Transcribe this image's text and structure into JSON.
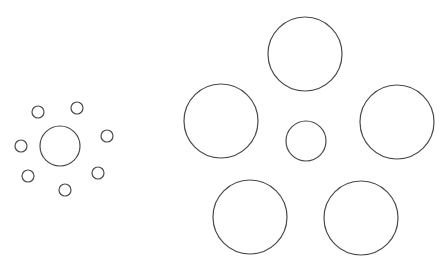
{
  "figure": {
    "name": "Ebbinghaus illusion",
    "width": 447,
    "height": 268,
    "stroke_color": "#4a4a4a",
    "background": "#ffffff"
  },
  "left_cluster": {
    "center": {
      "cx": 60,
      "cy": 146,
      "r": 20
    },
    "surrounding": [
      {
        "cx": 38,
        "cy": 112,
        "r": 6
      },
      {
        "cx": 77,
        "cy": 108,
        "r": 6
      },
      {
        "cx": 107,
        "cy": 136,
        "r": 6
      },
      {
        "cx": 21,
        "cy": 146,
        "r": 6
      },
      {
        "cx": 28,
        "cy": 176,
        "r": 6
      },
      {
        "cx": 98,
        "cy": 173,
        "r": 6
      },
      {
        "cx": 65,
        "cy": 190,
        "r": 6
      }
    ]
  },
  "right_cluster": {
    "center": {
      "cx": 306,
      "cy": 141,
      "r": 20
    },
    "surrounding": [
      {
        "cx": 305,
        "cy": 54,
        "r": 37
      },
      {
        "cx": 221,
        "cy": 121,
        "r": 37
      },
      {
        "cx": 397,
        "cy": 122,
        "r": 37
      },
      {
        "cx": 250,
        "cy": 217,
        "r": 37
      },
      {
        "cx": 361,
        "cy": 218,
        "r": 37
      }
    ]
  }
}
